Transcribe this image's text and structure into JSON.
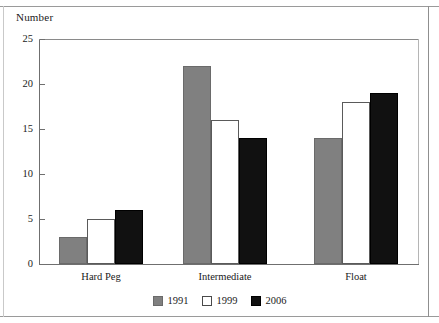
{
  "chart_data": {
    "type": "bar",
    "title": "",
    "ylabel": "Number",
    "xlabel": "",
    "categories": [
      "Hard Peg",
      "Intermediate",
      "Float"
    ],
    "series": [
      {
        "name": "1991",
        "color": "#808080",
        "values": [
          3,
          22,
          14
        ]
      },
      {
        "name": "1999",
        "color": "#ffffff",
        "values": [
          5,
          16,
          18
        ]
      },
      {
        "name": "2006",
        "color": "#111111",
        "values": [
          6,
          14,
          19
        ]
      }
    ],
    "ylim": [
      0,
      25
    ],
    "yticks": [
      0,
      5,
      10,
      15,
      20,
      25
    ],
    "ytick_labels": [
      "0",
      "5",
      "10",
      "15",
      "20",
      "25"
    ],
    "grid": false,
    "legend_position": "bottom"
  },
  "legend": {
    "items": [
      {
        "label": "1991",
        "swatch": "gray-swatch-icon"
      },
      {
        "label": "1999",
        "swatch": "white-swatch-icon"
      },
      {
        "label": "2006",
        "swatch": "black-swatch-icon"
      }
    ]
  }
}
